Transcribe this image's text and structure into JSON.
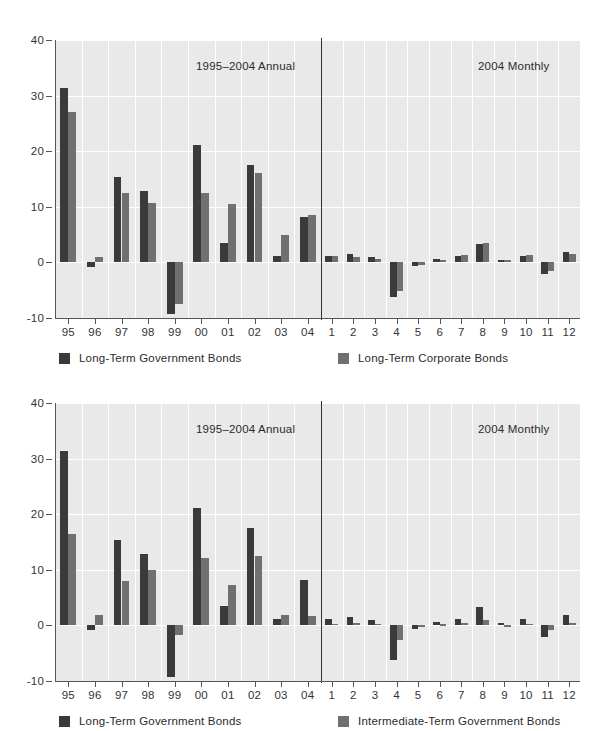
{
  "axis": {
    "y_ticks": [
      40,
      30,
      20,
      10,
      0,
      -10
    ],
    "y_tick_labels": [
      "40",
      "30",
      "20",
      "10",
      "0",
      "-10"
    ],
    "ylim": [
      -10,
      40
    ],
    "annual_categories": [
      "95",
      "96",
      "97",
      "98",
      "99",
      "00",
      "01",
      "02",
      "03",
      "04"
    ],
    "monthly_categories": [
      "1",
      "2",
      "3",
      "4",
      "5",
      "6",
      "7",
      "8",
      "9",
      "10",
      "11",
      "12"
    ]
  },
  "colors": {
    "series_dark": "#3a3a3a",
    "series_gray": "#707070",
    "plot_background": "#e9e9e9",
    "gridline": "#ffffff",
    "axis": "#555555",
    "text": "#2b2b2b"
  },
  "panels": [
    {
      "id": "panel-long-term-government-vs-corporate",
      "annual_title": "1995–2004 Annual",
      "monthly_title": "2004 Monthly",
      "legend": [
        {
          "label": "Long-Term Government Bonds",
          "swatch": "dark"
        },
        {
          "label": "Long-Term Corporate Bonds",
          "swatch": "gray"
        }
      ]
    },
    {
      "id": "panel-long-term-vs-intermediate-term-government",
      "annual_title": "1995–2004 Annual",
      "monthly_title": "2004 Monthly",
      "legend": [
        {
          "label": "Long-Term Government Bonds",
          "swatch": "dark"
        },
        {
          "label": "Intermediate-Term Government Bonds",
          "swatch": "gray"
        }
      ]
    }
  ],
  "chart_data": [
    {
      "type": "bar",
      "title": "Long-Term Government Bonds vs. Long-Term Corporate Bonds",
      "xlabel": "",
      "ylabel": "",
      "ylim": [
        -10,
        40
      ],
      "grid": true,
      "legend_position": "bottom",
      "sections": [
        {
          "name": "1995–2004 Annual",
          "categories": [
            "95",
            "96",
            "97",
            "98",
            "99",
            "00",
            "01",
            "02",
            "03",
            "04"
          ],
          "series": [
            {
              "name": "Long-Term Government Bonds",
              "color": "#3a3a3a",
              "values": [
                31.4,
                -0.9,
                15.4,
                12.8,
                -9.3,
                21.1,
                3.4,
                17.6,
                1.2,
                8.2
              ]
            },
            {
              "name": "Long-Term Corporate Bonds",
              "color": "#707070",
              "values": [
                27.0,
                1.0,
                12.5,
                10.6,
                -7.5,
                12.5,
                10.5,
                16.1,
                5.0,
                8.6
              ]
            }
          ]
        },
        {
          "name": "2004 Monthly",
          "categories": [
            "1",
            "2",
            "3",
            "4",
            "5",
            "6",
            "7",
            "8",
            "9",
            "10",
            "11",
            "12"
          ],
          "series": [
            {
              "name": "Long-Term Government Bonds",
              "color": "#3a3a3a",
              "values": [
                1.2,
                1.6,
                0.9,
                -6.3,
                -0.6,
                0.6,
                1.2,
                3.3,
                0.5,
                1.2,
                -2.1,
                1.9
              ]
            },
            {
              "name": "Long-Term Corporate Bonds",
              "color": "#707070",
              "values": [
                1.1,
                1.0,
                0.6,
                -5.2,
                -0.5,
                0.5,
                1.4,
                3.4,
                0.5,
                1.3,
                -1.6,
                1.6
              ]
            }
          ]
        }
      ]
    },
    {
      "type": "bar",
      "title": "Long-Term Government Bonds vs. Intermediate-Term Government Bonds",
      "xlabel": "",
      "ylabel": "",
      "ylim": [
        -10,
        40
      ],
      "grid": true,
      "legend_position": "bottom",
      "sections": [
        {
          "name": "1995–2004 Annual",
          "categories": [
            "95",
            "96",
            "97",
            "98",
            "99",
            "00",
            "01",
            "02",
            "03",
            "04"
          ],
          "series": [
            {
              "name": "Long-Term Government Bonds",
              "color": "#3a3a3a",
              "values": [
                31.4,
                -0.9,
                15.4,
                12.8,
                -9.3,
                21.1,
                3.4,
                17.6,
                1.2,
                8.2
              ]
            },
            {
              "name": "Intermediate-Term Government Bonds",
              "color": "#707070",
              "values": [
                16.5,
                1.8,
                7.9,
                10.0,
                -1.8,
                12.2,
                7.3,
                12.5,
                1.9,
                1.7
              ]
            }
          ]
        },
        {
          "name": "2004 Monthly",
          "categories": [
            "1",
            "2",
            "3",
            "4",
            "5",
            "6",
            "7",
            "8",
            "9",
            "10",
            "11",
            "12"
          ],
          "series": [
            {
              "name": "Long-Term Government Bonds",
              "color": "#3a3a3a",
              "values": [
                1.2,
                1.6,
                0.9,
                -6.3,
                -0.6,
                0.6,
                1.2,
                3.3,
                0.5,
                1.2,
                -2.1,
                1.9
              ]
            },
            {
              "name": "Intermediate-Term Government Bonds",
              "color": "#707070",
              "values": [
                0.3,
                0.4,
                0.3,
                -2.6,
                -0.2,
                0.2,
                0.4,
                1.0,
                0.0,
                0.3,
                -0.9,
                0.4
              ]
            }
          ]
        }
      ]
    }
  ]
}
